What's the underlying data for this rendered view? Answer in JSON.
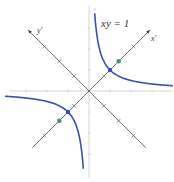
{
  "diagram": {
    "equation_label": "xy = 1",
    "axis_labels": {
      "x": "x",
      "y": "y",
      "x_rotated": "x'",
      "y_rotated": "y'"
    },
    "rotation_angle_deg": 45,
    "curve": "xy = 1 (hyperbola)",
    "points": [
      {
        "name": "vertex-first-quadrant",
        "x": 1,
        "y": 1,
        "color": "#3a4fa8"
      },
      {
        "name": "vertex-third-quadrant",
        "x": -1,
        "y": -1,
        "color": "#3a4fa8"
      },
      {
        "name": "focus-first-quadrant",
        "x": 1.414,
        "y": 1.414,
        "color": "#3f8f8a"
      },
      {
        "name": "focus-third-quadrant",
        "x": -1.414,
        "y": -1.414,
        "color": "#3f8f8a"
      }
    ],
    "colors": {
      "curve": "#3a4fa8",
      "axes": "#333333",
      "grid_axes": "#bbbbbb"
    }
  }
}
